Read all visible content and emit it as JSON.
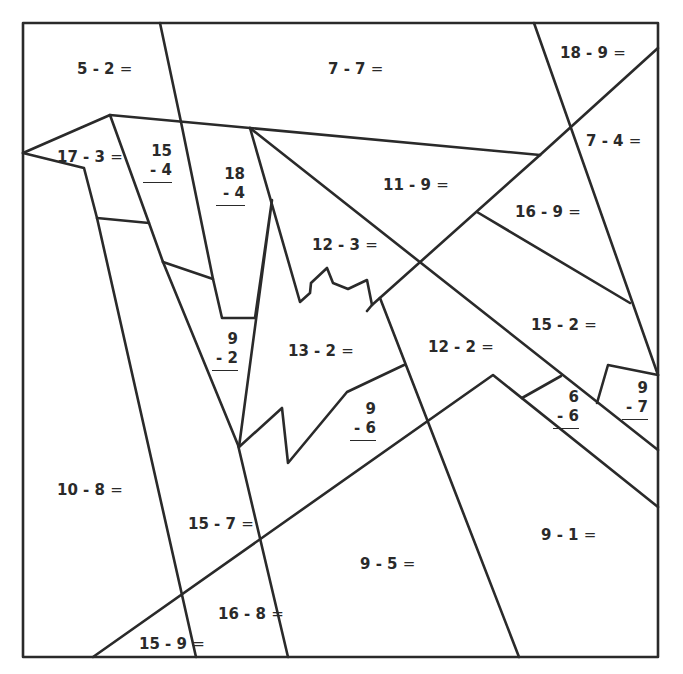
{
  "worksheet": {
    "type": "subtraction color-by-number",
    "line_color": "#2a2a2a",
    "horizontal_problems": [
      {
        "id": "p1",
        "text": "5 - 2",
        "x": 77,
        "y": 62
      },
      {
        "id": "p2",
        "text": "7 - 7",
        "x": 328,
        "y": 62
      },
      {
        "id": "p3",
        "text": "18 - 9",
        "x": 560,
        "y": 46
      },
      {
        "id": "p4",
        "text": "17 - 3",
        "x": 57,
        "y": 150
      },
      {
        "id": "p5",
        "text": "7 - 4",
        "x": 586,
        "y": 134
      },
      {
        "id": "p6",
        "text": "11 - 9",
        "x": 383,
        "y": 178
      },
      {
        "id": "p7",
        "text": "16 - 9",
        "x": 515,
        "y": 205
      },
      {
        "id": "p8",
        "text": "12 - 3",
        "x": 312,
        "y": 238
      },
      {
        "id": "p9",
        "text": "15 - 2",
        "x": 531,
        "y": 318
      },
      {
        "id": "p10",
        "text": "12 - 2",
        "x": 428,
        "y": 340
      },
      {
        "id": "p11",
        "text": "13 - 2",
        "x": 288,
        "y": 344
      },
      {
        "id": "p12",
        "text": "10 - 8",
        "x": 57,
        "y": 483
      },
      {
        "id": "p13",
        "text": "15 - 7",
        "x": 188,
        "y": 517
      },
      {
        "id": "p14",
        "text": "9 - 1",
        "x": 541,
        "y": 528
      },
      {
        "id": "p15",
        "text": "9 - 5",
        "x": 360,
        "y": 557
      },
      {
        "id": "p16",
        "text": "16 - 8",
        "x": 218,
        "y": 607
      },
      {
        "id": "p17",
        "text": "15 - 9",
        "x": 139,
        "y": 637
      }
    ],
    "equals_sign": "=",
    "vertical_problems": [
      {
        "id": "v1",
        "top": "15",
        "bottom": "- 4",
        "x": 143,
        "y": 142
      },
      {
        "id": "v2",
        "top": "18",
        "bottom": "- 4",
        "x": 216,
        "y": 165
      },
      {
        "id": "v3",
        "top": "9",
        "bottom": "- 2",
        "x": 212,
        "y": 330
      },
      {
        "id": "v4",
        "top": "9",
        "bottom": "- 6",
        "x": 350,
        "y": 400
      },
      {
        "id": "v5",
        "top": "6",
        "bottom": "- 6",
        "x": 557,
        "y": 388
      },
      {
        "id": "v6",
        "top": "9",
        "bottom": "- 7",
        "x": 624,
        "y": 379
      }
    ]
  }
}
